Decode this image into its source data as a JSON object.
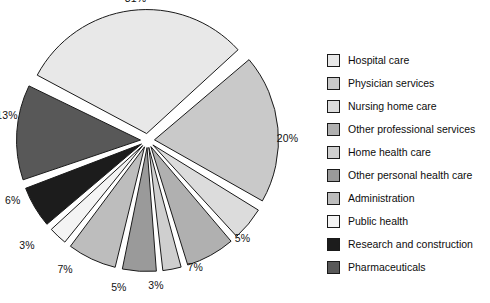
{
  "chart_data": {
    "type": "pie",
    "title": "",
    "subtitle": "",
    "xlabel": "",
    "ylabel": "",
    "legend_position": "right",
    "exploded": true,
    "categories": [
      "Hospital care",
      "Physician services",
      "Nursing home care",
      "Other professional services",
      "Home health care",
      "Other personal health care",
      "Administration",
      "Public health",
      "Research and construction",
      "Pharmaceuticals"
    ],
    "values": [
      31,
      20,
      5,
      7,
      3,
      5,
      7,
      3,
      6,
      13
    ],
    "value_labels": [
      "31%",
      "20%",
      "5%",
      "7%",
      "3%",
      "5%",
      "7%",
      "3%",
      "6%",
      "13%"
    ],
    "colors": [
      "#e8e8e8",
      "#c9c9c9",
      "#dcdcdc",
      "#b0b0b0",
      "#cfcfcf",
      "#9a9a9a",
      "#bdbdbd",
      "#f4f4f4",
      "#1c1c1c",
      "#585858"
    ],
    "slice_edge_color": "#1a1a1a",
    "slices": [
      {
        "label": "Hospital care",
        "value": 31,
        "value_label": "31%",
        "color": "#e8e8e8"
      },
      {
        "label": "Physician services",
        "value": 20,
        "value_label": "20%",
        "color": "#c9c9c9"
      },
      {
        "label": "Nursing home care",
        "value": 5,
        "value_label": "5%",
        "color": "#dcdcdc"
      },
      {
        "label": "Other professional services",
        "value": 7,
        "value_label": "7%",
        "color": "#b0b0b0"
      },
      {
        "label": "Home health care",
        "value": 3,
        "value_label": "3%",
        "color": "#cfcfcf"
      },
      {
        "label": "Other personal health care",
        "value": 5,
        "value_label": "5%",
        "color": "#9a9a9a"
      },
      {
        "label": "Administration",
        "value": 7,
        "value_label": "7%",
        "color": "#bdbdbd"
      },
      {
        "label": "Public health",
        "value": 3,
        "value_label": "3%",
        "color": "#f4f4f4"
      },
      {
        "label": "Research and construction",
        "value": 6,
        "value_label": "6%",
        "color": "#1c1c1c"
      },
      {
        "label": "Pharmaceuticals",
        "value": 13,
        "value_label": "13%",
        "color": "#585858"
      }
    ]
  },
  "legend": {
    "items": [
      {
        "label": "Hospital care",
        "color": "#e8e8e8"
      },
      {
        "label": "Physician services",
        "color": "#c9c9c9"
      },
      {
        "label": "Nursing home care",
        "color": "#dcdcdc"
      },
      {
        "label": "Other professional services",
        "color": "#b0b0b0"
      },
      {
        "label": "Home health care",
        "color": "#cfcfcf"
      },
      {
        "label": "Other personal health care",
        "color": "#9a9a9a"
      },
      {
        "label": "Administration",
        "color": "#bdbdbd"
      },
      {
        "label": "Public health",
        "color": "#f4f4f4"
      },
      {
        "label": "Research and construction",
        "color": "#1c1c1c"
      },
      {
        "label": "Pharmaceuticals",
        "color": "#585858"
      }
    ]
  }
}
